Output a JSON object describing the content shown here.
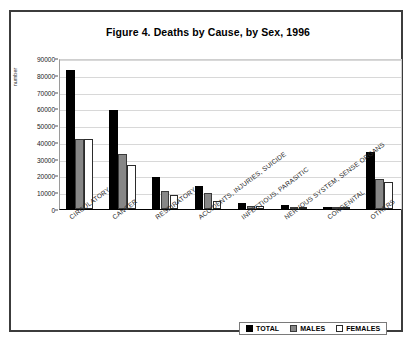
{
  "figure": {
    "title": "Figure 4. Deaths by Cause, by Sex, 1996",
    "ylabel": "number"
  },
  "legend": {
    "items": [
      {
        "label": "TOTAL",
        "color": "#000000"
      },
      {
        "label": "MALES",
        "color": "#878787"
      },
      {
        "label": "FEMALES",
        "color": "#ffffff"
      }
    ]
  },
  "chart_data": {
    "type": "bar",
    "title": "Figure 4. Deaths by Cause, by Sex, 1996",
    "xlabel": "",
    "ylabel": "number",
    "ylim": [
      0,
      90000
    ],
    "yticks": [
      0,
      10000,
      20000,
      30000,
      40000,
      50000,
      60000,
      70000,
      80000,
      90000
    ],
    "grid": true,
    "legend_position": "bottom-right",
    "categories": [
      "CIRCULATORY",
      "CANCER",
      "RESPIRATORY",
      "ACCIDENTS, INJURIES, SUICIDE",
      "INFECTIOUS, PARASITIC",
      "NERVOUS SYSTEM, SENSE ORGANS",
      "CONGENITAL",
      "OTHERS"
    ],
    "series": [
      {
        "name": "TOTAL",
        "color": "#000000",
        "values": [
          83000,
          59000,
          19000,
          14000,
          3500,
          2300,
          1400,
          34000
        ]
      },
      {
        "name": "MALES",
        "color": "#878787",
        "values": [
          42000,
          33000,
          11000,
          9500,
          2000,
          1200,
          800,
          18000
        ]
      },
      {
        "name": "FEMALES",
        "color": "#ffffff",
        "values": [
          42000,
          26000,
          8500,
          5000,
          1700,
          1100,
          700,
          16000
        ]
      }
    ]
  }
}
